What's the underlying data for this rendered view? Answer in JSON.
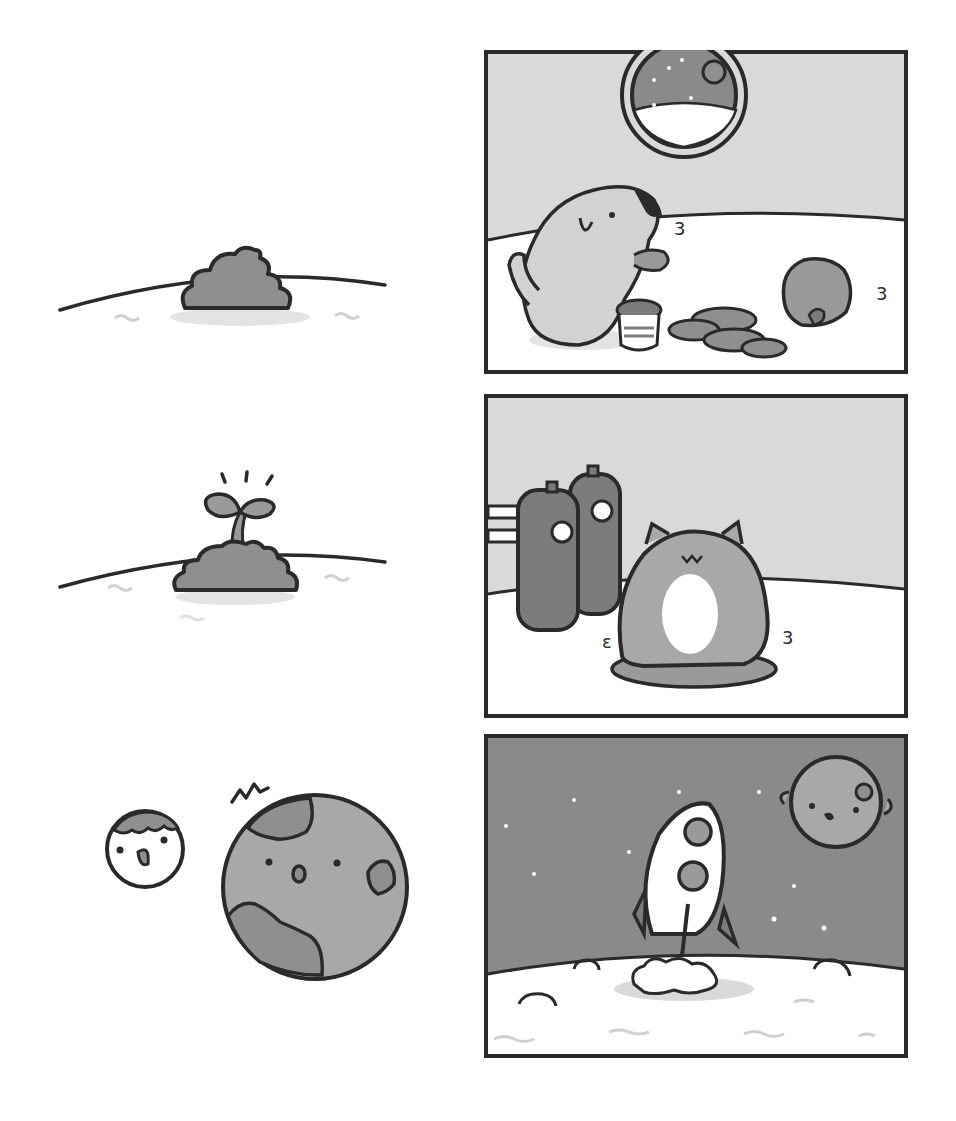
{
  "comic": {
    "panel_count": 6,
    "layout": "two columns: left unframed vignettes, right framed panels",
    "colors": {
      "ink": "#2a2a2a",
      "background": "#ffffff",
      "wall_gray": "#d9d9d9",
      "mid_gray": "#9a9a9a",
      "dark_gray": "#7c7c7c",
      "space_gray": "#8a8a8a",
      "ground_white": "#ffffff",
      "shadow_gray": "#e3e3e3"
    },
    "left_column": [
      {
        "id": "vignette-1",
        "subject": "soil mound on planet surface"
      },
      {
        "id": "vignette-2",
        "subject": "sprout growing from soil mound",
        "effect": "sparkle lines"
      },
      {
        "id": "vignette-3",
        "subject": "small smiling moon and large surprised planet",
        "effect": "surprise marks"
      }
    ],
    "right_column": [
      {
        "id": "panel-1",
        "subject": "dog and cat eating cookies in space base",
        "details": [
          "porthole window with stars and planet",
          "pot",
          "cookie pile",
          "chomp marks"
        ]
      },
      {
        "id": "panel-2",
        "subject": "angry round cat sitting on cushion next to gas tanks",
        "details": [
          "two oxygen tanks with gauges",
          "pipes",
          "shake marks"
        ]
      },
      {
        "id": "panel-3",
        "subject": "rocket launching from moon surface",
        "details": [
          "stars",
          "smiling planet",
          "craters",
          "exhaust cloud"
        ]
      }
    ],
    "sound_effects": [
      "3",
      "3",
      "3",
      "ε",
      "3"
    ]
  }
}
